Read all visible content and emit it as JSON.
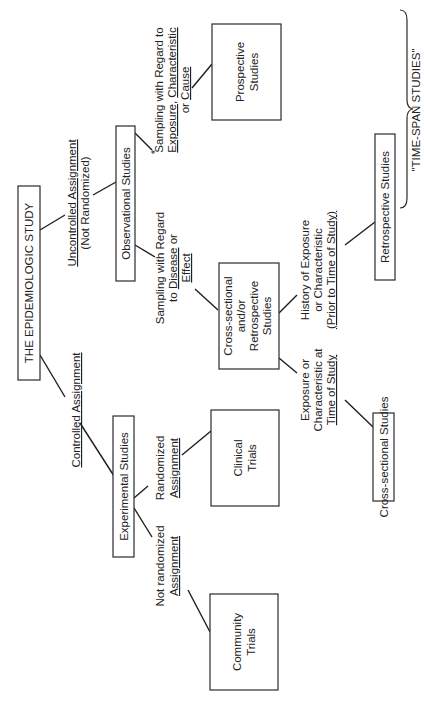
{
  "diagram": {
    "title": "THE EPIDEMIOLOGIC STUDY",
    "orientation": "rotated 90° counter-clockwise",
    "branches": {
      "controlled": {
        "label": "Controlled Assignment"
      },
      "uncontrolled": {
        "label_1": "Uncontrolled Assignment",
        "label_2": "(Not Randomized)"
      }
    },
    "nodes": {
      "experimental": "Experimental Studies",
      "observational": "Observational Studies",
      "clinical_1": "Clinical",
      "clinical_2": "Trials",
      "community_1": "Community",
      "community_2": "Trials",
      "prospective_1": "Prospective",
      "prospective_2": "Studies",
      "crossretro_1": "Cross-sectional",
      "crossretro_2": "and/or",
      "crossretro_3": "Retrospective",
      "crossretro_4": "Studies",
      "cross_sectional": "Cross-sectional Studies",
      "retrospective": "Retrospective Studies"
    },
    "edge_labels": {
      "randomized_1": "Randomized",
      "randomized_2": "Assignment",
      "not_randomized_1": "Not randomized",
      "not_randomized_2": "Assignment",
      "disease_1": "Sampling with Regard",
      "disease_2a": "to ",
      "disease_2b": "Disease",
      "disease_2c": " or",
      "disease_3": "Effect",
      "exposure_star": "*",
      "exposure_1": "Sampling with Regard to",
      "exposure_2a": "Exposure",
      "exposure_2b": ", ",
      "exposure_2c": "Characteristic",
      "exposure_3a": "or ",
      "exposure_3b": "Cause",
      "at_time_1": "Exposure or",
      "at_time_2": "Characteristic at",
      "at_time_3": "Time of Study",
      "history_1": "History of Exposure",
      "history_2": "or Characteristic",
      "history_3": "(Prior to Time of Study)"
    },
    "brace_label": "\"TIME-SPAN STUDIES\""
  }
}
